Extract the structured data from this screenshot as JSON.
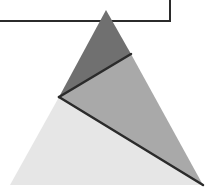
{
  "diagram": {
    "width": 213,
    "height": 195,
    "background": "#ffffff",
    "rectangle": {
      "x1": -5,
      "y1": -5,
      "x2": 170,
      "y2": 21,
      "stroke": "#2b2b2b",
      "stroke_width": 2,
      "fill": "#ffffff"
    },
    "triangle": {
      "apex": [
        106,
        10
      ],
      "bottom_left": [
        10,
        185
      ],
      "bottom_right": [
        203,
        185
      ]
    },
    "inner_point": [
      59,
      97
    ],
    "right_edge_point": [
      131,
      54
    ],
    "regions": [
      {
        "name": "top-region",
        "fill": "#707070",
        "points": [
          [
            106,
            10
          ],
          [
            131,
            54
          ],
          [
            59,
            97
          ]
        ]
      },
      {
        "name": "middle-region",
        "fill": "#a9a9a9",
        "points": [
          [
            131,
            54
          ],
          [
            203,
            185
          ],
          [
            59,
            97
          ]
        ]
      },
      {
        "name": "bottom-region",
        "fill": "#e6e6e6",
        "points": [
          [
            59,
            97
          ],
          [
            203,
            185
          ],
          [
            10,
            185
          ]
        ]
      }
    ],
    "lines": [
      {
        "name": "upper-divider",
        "from": [
          131,
          54
        ],
        "to": [
          59,
          97
        ],
        "stroke": "#2b2b2b",
        "width": 2.5
      },
      {
        "name": "lower-divider",
        "from": [
          59,
          97
        ],
        "to": [
          203,
          185
        ],
        "stroke": "#2b2b2b",
        "width": 2.5
      }
    ]
  }
}
